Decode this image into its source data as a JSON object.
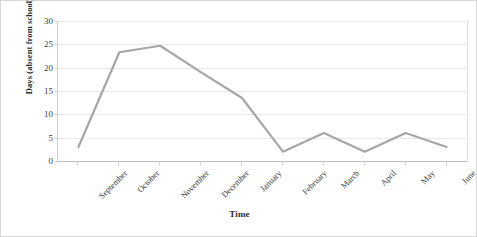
{
  "chart_data": {
    "type": "line",
    "title": "",
    "xlabel": "Time",
    "ylabel": "Days (absent from school)",
    "categories": [
      "September",
      "October",
      "November",
      "December",
      "January",
      "February",
      "March",
      "April",
      "May",
      "June"
    ],
    "values": [
      3,
      23.3,
      24.7,
      19,
      13.5,
      2,
      6,
      2,
      6,
      3
    ],
    "series": [
      {
        "name": "Days absent from school",
        "values": [
          3,
          23.3,
          24.7,
          19,
          13.5,
          2,
          6,
          2,
          6,
          3
        ],
        "color": "#a6a6a6"
      }
    ],
    "ylim": [
      0,
      30
    ],
    "ytick_step": 5,
    "yticks": [
      0,
      5,
      10,
      15,
      20,
      25,
      30
    ],
    "ytick_labels": [
      "0",
      "5",
      "10",
      "15",
      "20",
      "25",
      "30"
    ],
    "grid": "horizontal",
    "legend": "none",
    "line_color": "#a6a6a6",
    "gridline_color": "#e9e9e9",
    "axis_color": "#bfbfbf",
    "background": "#ffffff",
    "xtick_rotation": -45,
    "markers": "none"
  },
  "caption": ""
}
